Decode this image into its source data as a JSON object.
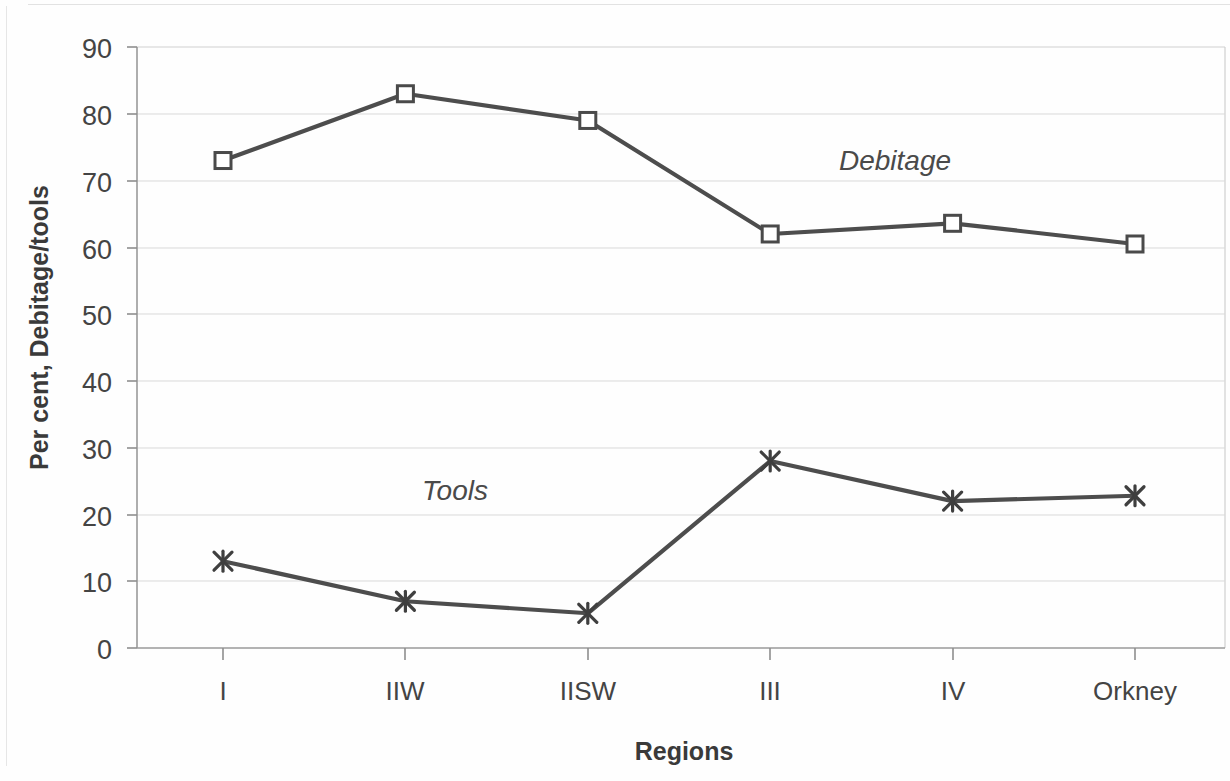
{
  "chart_data": {
    "type": "line",
    "title": "",
    "xlabel": "Regions",
    "ylabel": "Per cent, Debitage/tools",
    "categories": [
      "I",
      "IIW",
      "IISW",
      "III",
      "IV",
      "Orkney"
    ],
    "ylim": [
      0,
      90
    ],
    "yticks": [
      0,
      10,
      20,
      30,
      40,
      50,
      60,
      70,
      80,
      90
    ],
    "ytick_labels": [
      "0",
      "10",
      "20",
      "30",
      "40",
      "50",
      "60",
      "70",
      "80",
      "90"
    ],
    "grid": true,
    "legend_position": "inline-annotation",
    "series": [
      {
        "name": "Debitage",
        "marker": "open-square",
        "color": "#4d4d4d",
        "values": [
          73,
          83,
          79,
          62,
          63.6,
          60.5
        ],
        "annotation": "Debitage",
        "annotation_x": "III",
        "annotation_y": 72
      },
      {
        "name": "Tools",
        "marker": "star",
        "color": "#4d4d4d",
        "values": [
          13,
          7,
          5.2,
          28,
          22,
          22.8
        ],
        "annotation": "Tools",
        "annotation_x": "IIW",
        "annotation_y": 25.5
      }
    ]
  },
  "axes": {
    "y_axis_title": "Per cent, Debitage/tools",
    "x_axis_title": "Regions"
  },
  "annotations": {
    "debitage_label": "Debitage",
    "tools_label": "Tools"
  }
}
